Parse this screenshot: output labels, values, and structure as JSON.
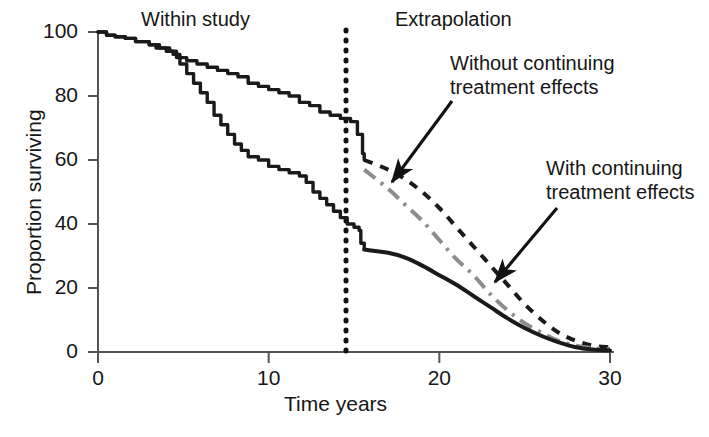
{
  "chart_data": {
    "type": "line",
    "title": "",
    "xlabel": "Time years",
    "ylabel": "Proportion surviving",
    "xlim": [
      0,
      30
    ],
    "ylim": [
      0,
      100
    ],
    "xticks": [
      0,
      10,
      20,
      30
    ],
    "yticks": [
      0,
      20,
      40,
      60,
      80,
      100
    ],
    "xtick_labels": [
      "0",
      "10",
      "20",
      "30"
    ],
    "ytick_labels": [
      "0",
      "20",
      "40",
      "60",
      "80",
      "100"
    ],
    "grid": false,
    "legend": "none",
    "region_divider_x": 15.6,
    "regions": [
      {
        "label": "Within study",
        "x_range": [
          0,
          15.6
        ]
      },
      {
        "label": "Extrapolation",
        "x_range": [
          15.6,
          30
        ]
      }
    ],
    "annotations": [
      {
        "text": "Without continuing treatment effects",
        "points_to_series": "no-continuing-effects-extrapolation",
        "target_xy": [
          17.0,
          44.0
        ]
      },
      {
        "text": "With continuing treatment effects",
        "points_to_series": "with-continuing-effects-extrapolation",
        "target_xy": [
          23.0,
          21.0
        ]
      }
    ],
    "series": [
      {
        "name": "km-upper-treatment",
        "style": "solid",
        "color": "#1a1a1a",
        "phase": "within-study",
        "step": true,
        "points": [
          [
            0,
            100
          ],
          [
            0.5,
            99
          ],
          [
            1.0,
            98.5
          ],
          [
            1.6,
            98
          ],
          [
            2.2,
            97
          ],
          [
            3.0,
            96
          ],
          [
            3.6,
            95
          ],
          [
            4.2,
            94
          ],
          [
            4.6,
            92
          ],
          [
            5.2,
            91
          ],
          [
            5.8,
            90
          ],
          [
            6.4,
            89
          ],
          [
            7.0,
            88
          ],
          [
            7.6,
            87
          ],
          [
            8.2,
            86
          ],
          [
            8.8,
            84
          ],
          [
            9.4,
            83
          ],
          [
            10.0,
            82
          ],
          [
            10.6,
            81
          ],
          [
            11.2,
            80
          ],
          [
            11.8,
            78
          ],
          [
            12.4,
            77
          ],
          [
            13.0,
            75
          ],
          [
            13.6,
            74
          ],
          [
            14.2,
            73
          ],
          [
            14.8,
            72
          ],
          [
            15.2,
            68
          ],
          [
            15.5,
            62
          ],
          [
            15.6,
            60
          ]
        ]
      },
      {
        "name": "km-lower-control",
        "style": "solid",
        "color": "#1a1a1a",
        "phase": "within-study",
        "step": true,
        "points": [
          [
            0,
            100
          ],
          [
            0.5,
            99
          ],
          [
            1.0,
            98.5
          ],
          [
            1.6,
            98
          ],
          [
            2.2,
            97
          ],
          [
            3.0,
            96
          ],
          [
            3.4,
            95
          ],
          [
            4.0,
            94
          ],
          [
            4.4,
            93
          ],
          [
            4.8,
            90
          ],
          [
            5.2,
            87
          ],
          [
            5.6,
            84
          ],
          [
            6.0,
            81
          ],
          [
            6.4,
            78
          ],
          [
            6.8,
            74
          ],
          [
            7.2,
            71
          ],
          [
            7.6,
            68
          ],
          [
            8.0,
            65
          ],
          [
            8.4,
            63
          ],
          [
            8.8,
            61
          ],
          [
            9.4,
            60
          ],
          [
            10.0,
            58
          ],
          [
            10.6,
            57
          ],
          [
            11.2,
            56
          ],
          [
            11.8,
            55
          ],
          [
            12.2,
            53
          ],
          [
            12.6,
            50
          ],
          [
            13.0,
            48
          ],
          [
            13.4,
            46
          ],
          [
            13.8,
            44
          ],
          [
            14.2,
            42
          ],
          [
            14.6,
            40
          ],
          [
            15.0,
            39
          ],
          [
            15.3,
            38
          ],
          [
            15.4,
            34
          ],
          [
            15.6,
            32
          ]
        ]
      },
      {
        "name": "no-continuing-effects-extrapolation",
        "style": "dashed",
        "color": "#1a1a1a",
        "phase": "extrapolation",
        "points": [
          [
            15.6,
            60
          ],
          [
            17,
            57
          ],
          [
            18,
            54
          ],
          [
            19,
            50
          ],
          [
            20,
            45
          ],
          [
            21,
            39
          ],
          [
            22,
            33
          ],
          [
            23,
            27
          ],
          [
            24,
            21
          ],
          [
            25,
            15
          ],
          [
            26,
            10
          ],
          [
            27,
            6
          ],
          [
            28,
            3.5
          ],
          [
            29,
            2
          ],
          [
            30,
            1.5
          ]
        ]
      },
      {
        "name": "intermediate-extrapolation",
        "style": "dash-dot",
        "color": "#8c8c8c",
        "phase": "extrapolation",
        "points": [
          [
            15.6,
            57
          ],
          [
            17,
            51
          ],
          [
            18,
            46
          ],
          [
            19,
            41
          ],
          [
            20,
            35
          ],
          [
            21,
            29
          ],
          [
            22,
            24
          ],
          [
            23,
            18
          ],
          [
            24,
            13
          ],
          [
            25,
            9
          ],
          [
            26,
            6
          ],
          [
            27,
            3.5
          ],
          [
            28,
            2
          ],
          [
            29,
            1.2
          ],
          [
            30,
            1
          ]
        ]
      },
      {
        "name": "with-continuing-effects-extrapolation",
        "style": "solid",
        "color": "#1a1a1a",
        "phase": "extrapolation",
        "points": [
          [
            15.6,
            32
          ],
          [
            17,
            31
          ],
          [
            18,
            29.5
          ],
          [
            19,
            27
          ],
          [
            20,
            24
          ],
          [
            21,
            21
          ],
          [
            22,
            17.5
          ],
          [
            23,
            14
          ],
          [
            24,
            10.5
          ],
          [
            25,
            7.5
          ],
          [
            26,
            5
          ],
          [
            27,
            3
          ],
          [
            28,
            1.5
          ],
          [
            29,
            0.8
          ],
          [
            30,
            0.5
          ]
        ]
      }
    ]
  },
  "axis": {
    "y_title": "Proportion surviving",
    "x_title": "Time years"
  },
  "headers": {
    "within_study": "Within study",
    "extrapolation": "Extrapolation"
  },
  "annotations": {
    "without_line1": "Without continuing",
    "without_line2": "treatment effects",
    "with_line1": "With continuing",
    "with_line2": "treatment effects"
  },
  "colors": {
    "ink": "#1a1a1a",
    "axis": "#555555",
    "gray_series": "#8c8c8c"
  }
}
